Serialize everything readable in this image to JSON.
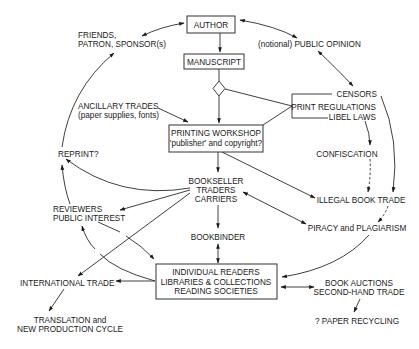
{
  "diagram": {
    "colors": {
      "line": "#2a2a2a",
      "text": "#1a1a1a",
      "background": "#ffffff"
    },
    "nodes": {
      "author": "AUTHOR",
      "manuscript": "MANUSCRIPT",
      "printing_workshop": [
        "PRINTING WORKSHOP",
        "'publisher' and copyright?"
      ],
      "friends": [
        "FRIENDS,",
        "PATRON, SPONSOR(s)"
      ],
      "public_opinion": "(notional) PUBLIC OPINION",
      "censors": "CENSORS",
      "print_regulations": "PRINT REGULATIONS",
      "libel_laws": "LIBEL LAWS",
      "ancillary": [
        "ANCILLARY TRADES",
        "(paper supplies, fonts)"
      ],
      "confiscation": "CONFISCATION",
      "reprint": "REPRINT?",
      "bookseller": [
        "BOOKSELLER",
        "TRADERS",
        "CARRIERS"
      ],
      "illegal_trade": "ILLEGAL BOOK TRADE",
      "reviewers": [
        "REVIEWERS",
        "PUBLIC INTEREST"
      ],
      "piracy": "PIRACY and PLAGIARISM",
      "bookbinder": "BOOKBINDER",
      "readers": [
        "INDIVIDUAL READERS",
        "LIBRARIES & COLLECTIONS",
        "READING SOCIETIES"
      ],
      "international": "INTERNATIONAL TRADE",
      "auctions": [
        "BOOK AUCTIONS",
        "SECOND-HAND TRADE"
      ],
      "translation": [
        "TRANSLATION and",
        "NEW PRODUCTION CYCLE"
      ],
      "recycling": "? PAPER RECYCLING"
    },
    "edges": [
      {
        "from": "author",
        "to": "friends",
        "type": "bidirectional"
      },
      {
        "from": "author",
        "to": "public_opinion",
        "type": "bidirectional"
      },
      {
        "from": "public_opinion",
        "to": "censors",
        "type": "bidirectional"
      },
      {
        "from": "author",
        "to": "manuscript",
        "type": "arrow"
      },
      {
        "from": "manuscript",
        "to": "printing_workshop",
        "type": "arrow",
        "via": "decision-diamond"
      },
      {
        "from": "decision-diamond",
        "to": "censors-bracket",
        "type": "line"
      },
      {
        "from": "censors-bracket",
        "to": "printing_workshop",
        "type": "line"
      },
      {
        "from": "ancillary",
        "to": "printing_workshop",
        "type": "arrow"
      },
      {
        "from": "printing_workshop",
        "to": "bookseller",
        "type": "arrow"
      },
      {
        "from": "printing_workshop",
        "to": "illegal_trade",
        "type": "arrow"
      },
      {
        "from": "libel_laws",
        "to": "confiscation",
        "type": "arrow"
      },
      {
        "from": "confiscation",
        "to": "illegal_trade",
        "type": "dashed-arrow"
      },
      {
        "from": "censors",
        "to": "illegal_trade",
        "type": "arrow"
      },
      {
        "from": "illegal_trade",
        "to": "piracy",
        "type": "dashed-arrow"
      },
      {
        "from": "bookseller",
        "to": "piracy",
        "type": "bidirectional"
      },
      {
        "from": "bookseller",
        "to": "reprint",
        "type": "arrow"
      },
      {
        "from": "bookseller",
        "to": "reviewers",
        "type": "arrow"
      },
      {
        "from": "bookseller",
        "to": "international",
        "type": "arrow"
      },
      {
        "from": "bookseller",
        "to": "bookbinder",
        "type": "arrow"
      },
      {
        "from": "bookbinder",
        "to": "readers",
        "type": "bidirectional"
      },
      {
        "from": "reviewers",
        "to": "readers",
        "type": "arrow"
      },
      {
        "from": "readers",
        "to": "reviewers",
        "type": "arrow"
      },
      {
        "from": "readers",
        "to": "international",
        "type": "arrow"
      },
      {
        "from": "piracy",
        "to": "readers",
        "type": "arrow"
      },
      {
        "from": "readers",
        "to": "auctions",
        "type": "bidirectional"
      },
      {
        "from": "auctions",
        "to": "recycling",
        "type": "arrow"
      },
      {
        "from": "international",
        "to": "translation",
        "type": "arrow"
      },
      {
        "from": "reviewers",
        "to": "reprint",
        "type": "arrow"
      },
      {
        "from": "reprint",
        "to": "friends",
        "type": "arrow"
      }
    ]
  }
}
